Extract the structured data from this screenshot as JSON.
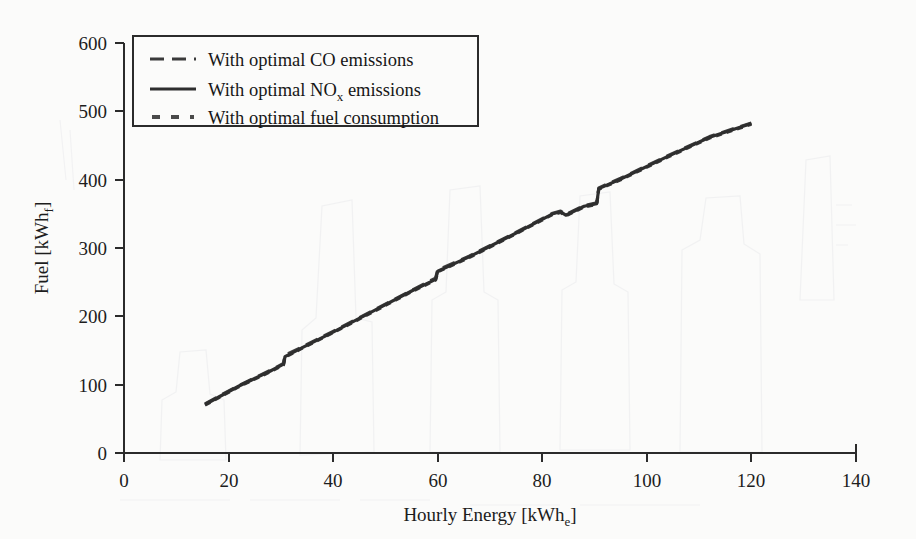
{
  "chart_data": {
    "type": "line",
    "title": "",
    "xlabel": "Hourly Energy [kWhe]",
    "ylabel": "Fuel [kWhf]",
    "xlabel_main": "Hourly Energy [kWh",
    "xlabel_sub": "e",
    "xlabel_end": "]",
    "ylabel_main": "Fuel [kWh",
    "ylabel_sub": "f",
    "ylabel_end": "]",
    "xlim": [
      0,
      140
    ],
    "ylim": [
      0,
      600
    ],
    "xticks": [
      0,
      20,
      40,
      60,
      80,
      100,
      120,
      140
    ],
    "yticks": [
      0,
      100,
      200,
      300,
      400,
      500,
      600
    ],
    "grid": false,
    "legend_position": "upper-left",
    "line_color": "#333333",
    "axis_color": "#2b2b2b",
    "background": "#fbfbfa",
    "series": [
      {
        "name": "With optimal CO emissions",
        "style": "long-dash",
        "x": [
          15.5,
          22,
          28,
          30.5,
          30.8,
          34,
          40,
          48,
          55,
          59.6,
          60.0,
          66,
          74,
          82,
          83.5,
          84.5,
          88,
          90.4,
          90.8,
          95,
          104,
          112,
          120
        ],
        "y": [
          72,
          99,
          121,
          131,
          143,
          155,
          178,
          210,
          238,
          256,
          268,
          288,
          319,
          351,
          354,
          349,
          362,
          366,
          388,
          402,
          435,
          463,
          483
        ]
      },
      {
        "name": "With optimal NOx emissions",
        "style": "solid",
        "x": [
          15.5,
          22,
          28,
          30.5,
          30.8,
          34,
          40,
          48,
          55,
          59.6,
          60.0,
          66,
          74,
          82,
          83.5,
          84.5,
          88,
          90.4,
          90.8,
          95,
          104,
          112,
          120
        ],
        "y": [
          71,
          98,
          120,
          130,
          141,
          154,
          177,
          209,
          237,
          254,
          266,
          287,
          318,
          350,
          353,
          348,
          361,
          365,
          387,
          401,
          434,
          462,
          482
        ]
      },
      {
        "name": "With optimal fuel consumption",
        "style": "short-dash",
        "x": [
          15.5,
          22,
          28,
          30.5,
          30.8,
          34,
          40,
          48,
          55,
          59.6,
          60.0,
          66,
          74,
          82,
          83.5,
          84.5,
          88,
          90.4,
          90.8,
          95,
          104,
          112,
          120
        ],
        "y": [
          70,
          97,
          119,
          129,
          140,
          153,
          176,
          208,
          236,
          253,
          265,
          286,
          317,
          349,
          352,
          347,
          360,
          364,
          386,
          400,
          433,
          461,
          481
        ]
      }
    ]
  },
  "legend": {
    "entries": [
      {
        "label": "With optimal CO emissions",
        "style": "long-dash"
      },
      {
        "label_main": "With optimal NO",
        "label_sub": "x",
        "label_end": " emissions",
        "style": "solid"
      },
      {
        "label": "With optimal fuel consumption",
        "style": "short-dash"
      }
    ]
  }
}
